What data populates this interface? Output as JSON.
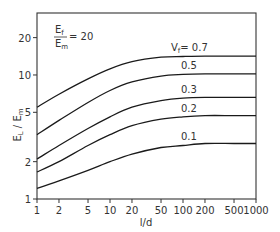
{
  "chart_data": {
    "type": "line",
    "title": "",
    "annotation": {
      "numerator": "E",
      "numerator_sub": "f",
      "denominator": "E",
      "denominator_sub": "m",
      "equals": "= 20"
    },
    "xlabel": "l/d",
    "ylabel": "E_L / E_m",
    "ylabel_parts": {
      "main1": "E",
      "sub1": "L",
      "slash": " / ",
      "main2": "E",
      "sub2": "m"
    },
    "xscale": "log",
    "yscale": "log",
    "xlim": [
      1,
      1000
    ],
    "ylim": [
      1,
      31.6
    ],
    "grid": false,
    "legend": "inline labels",
    "x_ticks": [
      1,
      2,
      5,
      10,
      20,
      50,
      100,
      200,
      500,
      1000
    ],
    "x_tick_labels": [
      "1",
      "2",
      "5",
      "10",
      "20",
      "50",
      "100",
      "200",
      "500",
      "1000"
    ],
    "y_ticks": [
      1,
      2,
      5,
      10,
      20
    ],
    "y_tick_labels": [
      "1",
      "2",
      "5",
      "10",
      "20"
    ],
    "x": [
      1,
      2,
      5,
      10,
      20,
      50,
      100,
      200,
      500,
      1000
    ],
    "series": [
      {
        "name": "Vf = 0.7",
        "label": "V",
        "label_sub": "f",
        "label_rest": "= 0.7",
        "values": [
          5.5,
          7.0,
          9.3,
          11.2,
          12.8,
          13.9,
          14.1,
          14.2,
          14.2,
          14.2
        ]
      },
      {
        "name": "0.5",
        "label": "0.5",
        "values": [
          3.3,
          4.3,
          6.0,
          7.5,
          8.8,
          9.8,
          10.1,
          10.2,
          10.2,
          10.2
        ]
      },
      {
        "name": "0.3",
        "label": "0.3",
        "values": [
          2.1,
          2.7,
          3.7,
          4.6,
          5.5,
          6.2,
          6.5,
          6.6,
          6.6,
          6.6
        ]
      },
      {
        "name": "0.2",
        "label": "0.2",
        "values": [
          1.65,
          2.0,
          2.7,
          3.3,
          3.9,
          4.4,
          4.6,
          4.7,
          4.7,
          4.7
        ]
      },
      {
        "name": "0.1",
        "label": "0.1",
        "values": [
          1.22,
          1.4,
          1.7,
          2.0,
          2.3,
          2.6,
          2.7,
          2.8,
          2.8,
          2.8
        ]
      }
    ]
  },
  "colors": {
    "line": "#1a1a1a",
    "frame": "#333333",
    "text": "#333333"
  }
}
